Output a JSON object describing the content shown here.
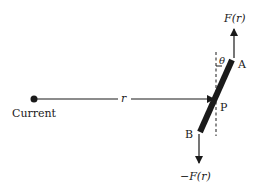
{
  "diagram": {
    "type": "physics-force-diagram",
    "colors": {
      "ink": "#1a1a1a",
      "background": "#ffffff"
    },
    "labels": {
      "current": "Current",
      "distance": "r",
      "force_up": "F(r)",
      "force_down": "−F(r)",
      "angle": "θ",
      "point_a": "A",
      "point_b": "B",
      "point_p": "P"
    },
    "elements": [
      {
        "id": "current-source",
        "kind": "dot",
        "label": "Current"
      },
      {
        "id": "distance-line",
        "kind": "arrow",
        "direction": "right",
        "label": "r"
      },
      {
        "id": "rod",
        "kind": "thick-line",
        "from": "B",
        "to": "A",
        "midpoint": "P"
      },
      {
        "id": "vertical-reference",
        "kind": "dashed-line",
        "through": "P"
      },
      {
        "id": "force-at-a",
        "kind": "arrow",
        "direction": "up",
        "label": "F(r)"
      },
      {
        "id": "force-at-b",
        "kind": "arrow",
        "direction": "down",
        "label": "−F(r)"
      },
      {
        "id": "angle-marker",
        "kind": "angle",
        "between": [
          "vertical-reference",
          "rod"
        ],
        "label": "θ"
      }
    ]
  }
}
